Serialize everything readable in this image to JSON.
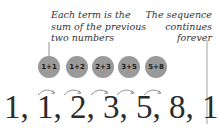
{
  "annotations": {
    "left": [
      "Each term is the",
      "sum of the previous",
      "two numbers"
    ],
    "right": [
      "The sequence",
      "continues",
      "forever"
    ]
  },
  "bubbles": [
    {
      "label": "1+1",
      "x": 38
    },
    {
      "label": "1+2",
      "x": 66
    },
    {
      "label": "2+3",
      "x": 92
    },
    {
      "label": "3+5",
      "x": 118
    },
    {
      "label": "5+8",
      "x": 145
    }
  ],
  "sequence": "1, 1, 2, 3, 5, 8, 13 ...",
  "colors": {
    "bubble": "#9a9a9a",
    "text": "#2b2b2b",
    "line": "#777777"
  }
}
